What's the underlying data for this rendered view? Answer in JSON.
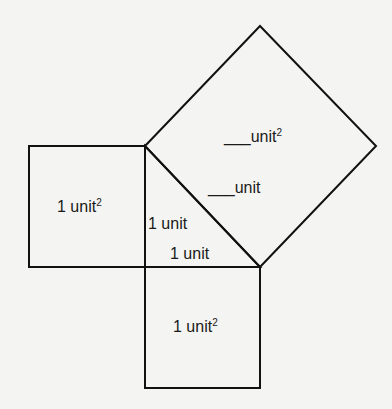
{
  "diagram": {
    "title": "",
    "stroke_color": "#111111",
    "background": "#f4f4f2",
    "shapes": {
      "left_square": {
        "label": "1 unit",
        "exponent": "2",
        "points": [
          [
            29,
            146
          ],
          [
            145,
            146
          ],
          [
            145,
            267
          ],
          [
            29,
            267
          ]
        ]
      },
      "bottom_square": {
        "label": "1 unit",
        "exponent": "2",
        "points": [
          [
            145,
            267
          ],
          [
            260,
            267
          ],
          [
            260,
            388
          ],
          [
            145,
            388
          ]
        ]
      },
      "hypotenuse_square": {
        "label": "___unit",
        "exponent": "2",
        "points": [
          [
            145,
            146
          ],
          [
            260,
            26
          ],
          [
            376,
            146
          ],
          [
            260,
            267
          ]
        ]
      },
      "triangle": {
        "points": [
          [
            145,
            146
          ],
          [
            145,
            267
          ],
          [
            260,
            267
          ]
        ]
      }
    },
    "labels": {
      "left_area": "1 unit",
      "left_area_exp": "2",
      "bottom_area": "1 unit",
      "bottom_area_exp": "2",
      "hyp_area": "___unit",
      "hyp_area_exp": "2",
      "hyp_side": "___unit",
      "vertical_leg": "1 unit",
      "horizontal_leg": "1 unit"
    }
  }
}
